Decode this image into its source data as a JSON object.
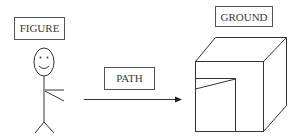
{
  "diagram": {
    "labels": {
      "figure": "FIGURE",
      "path": "PATH",
      "ground": "GROUND"
    },
    "elements": [
      {
        "id": "figure",
        "type": "stick-figure",
        "label": "FIGURE"
      },
      {
        "id": "path",
        "type": "arrow",
        "label": "PATH",
        "direction": "right"
      },
      {
        "id": "ground",
        "type": "cube-with-opening",
        "label": "GROUND"
      }
    ],
    "colors": {
      "stroke": "#333333",
      "text": "#3a3a3a",
      "background": "#ffffff"
    }
  }
}
